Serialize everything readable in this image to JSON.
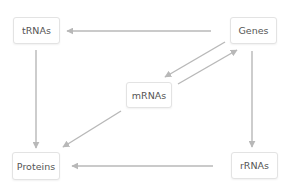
{
  "diagram": {
    "title": "",
    "nodes": [
      {
        "id": "trnas",
        "label": "tRNAs",
        "x": 13,
        "y": 17,
        "w": 47,
        "h": 27
      },
      {
        "id": "genes",
        "label": "Genes",
        "x": 230,
        "y": 17,
        "w": 47,
        "h": 27
      },
      {
        "id": "mrnas",
        "label": "mRNAs",
        "x": 126,
        "y": 82,
        "w": 46,
        "h": 26
      },
      {
        "id": "proteins",
        "label": "Proteins",
        "x": 12,
        "y": 152,
        "w": 48,
        "h": 28
      },
      {
        "id": "rrnas",
        "label": "rRNAs",
        "x": 231,
        "y": 152,
        "w": 47,
        "h": 27
      }
    ],
    "edges": [
      {
        "from": "genes",
        "to": "trnas",
        "x1": 211,
        "y1": 31,
        "x2": 67,
        "y2": 31
      },
      {
        "from": "trnas",
        "to": "proteins",
        "x1": 36,
        "y1": 50,
        "x2": 36,
        "y2": 148
      },
      {
        "from": "genes",
        "to": "rrnas",
        "x1": 252,
        "y1": 51,
        "x2": 252,
        "y2": 147
      },
      {
        "from": "rrnas",
        "to": "proteins",
        "x1": 213,
        "y1": 166,
        "x2": 72,
        "y2": 166
      },
      {
        "from": "mrnas",
        "to": "proteins",
        "x1": 121,
        "y1": 111,
        "x2": 63,
        "y2": 147
      },
      {
        "from": "genes",
        "to": "mrnas",
        "x1": 225,
        "y1": 42,
        "x2": 165,
        "y2": 77
      },
      {
        "from": "mrnas",
        "to": "genes",
        "x1": 178,
        "y1": 84,
        "x2": 237,
        "y2": 50
      }
    ],
    "colors": {
      "edge": "#b8b8b8",
      "node_border": "#e3e3e3",
      "node_text": "#555555",
      "background": "#ffffff"
    }
  }
}
